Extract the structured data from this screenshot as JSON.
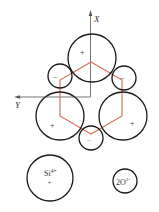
{
  "diagram": {
    "colors": {
      "circle": "#1a1a1a",
      "hexagon": "#d9735a",
      "axis": "#777777",
      "minus": "#6a8fb8"
    },
    "axes": {
      "x_label": "X",
      "y_label": "Y"
    },
    "ions": {
      "large": [
        {
          "pos": "top",
          "sign": "+"
        },
        {
          "pos": "bottom-left",
          "sign": "+"
        },
        {
          "pos": "bottom-right",
          "sign": "+"
        }
      ],
      "small": [
        {
          "pos": "upper-left",
          "sign": "−"
        },
        {
          "pos": "upper-right",
          "sign": "−"
        },
        {
          "pos": "bottom",
          "sign": "−"
        }
      ]
    },
    "legend": {
      "si": {
        "label": "Si",
        "charge": "4+",
        "sign": "+"
      },
      "o": {
        "label": "2O",
        "charge": "2−"
      }
    }
  }
}
